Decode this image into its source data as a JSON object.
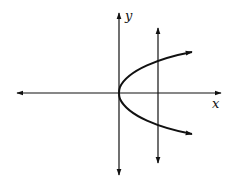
{
  "diagram": {
    "type": "vertical-line-test",
    "axes": {
      "x_label": "x",
      "y_label": "y"
    },
    "curve": {
      "name": "parabola",
      "equation_form": "x = a*y^2",
      "vertex": "origin",
      "opens": "right",
      "arrows_on_ends": true
    },
    "vertical_line": {
      "position": "x > 0",
      "intersections_with_curve": 2,
      "arrows_on_ends": true
    },
    "colors": {
      "stroke": "#111111",
      "background": "#ffffff"
    }
  }
}
